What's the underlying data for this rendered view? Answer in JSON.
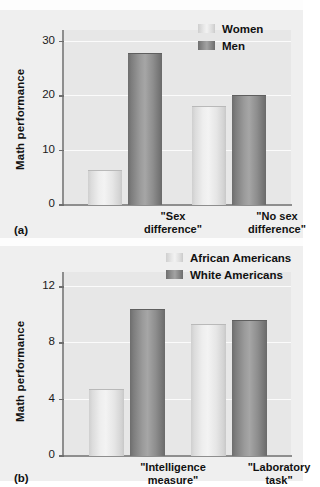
{
  "page": {
    "background_color": "#efefef",
    "paper_color": "#fdfdfd"
  },
  "colors": {
    "light_bar": "#e9e9e9",
    "dark_bar": "#8d8d8d",
    "plot_background": "#e7e7e7",
    "gridline": "#fbfbfb",
    "axis": "#8e8e8e",
    "text": "#111111"
  },
  "figure_a": {
    "panel_label": "(a)",
    "y_axis_title": "Math performance",
    "y_ticks": [
      "0",
      "10",
      "20",
      "30"
    ],
    "legend": [
      {
        "label": "Women",
        "swatch": "light"
      },
      {
        "label": "Men",
        "swatch": "dark"
      }
    ],
    "categories": [
      {
        "line1": "\"Sex",
        "line2": "difference\""
      },
      {
        "line1": "\"No sex",
        "line2": "difference\""
      }
    ]
  },
  "figure_b": {
    "panel_label": "(b)",
    "y_axis_title": "Math performance",
    "y_ticks": [
      "0",
      "4",
      "8",
      "12"
    ],
    "legend": [
      {
        "label": "African Americans",
        "swatch": "light"
      },
      {
        "label": "White Americans",
        "swatch": "dark"
      }
    ],
    "categories": [
      {
        "line1": "\"Intelligence",
        "line2": "measure\""
      },
      {
        "line1": "\"Laboratory",
        "line2": "task\""
      }
    ]
  },
  "chart_data": [
    {
      "type": "bar",
      "title": "(a)",
      "xlabel": "",
      "ylabel": "Math performance",
      "ylim": [
        0,
        32
      ],
      "yticks": [
        0,
        10,
        20,
        30
      ],
      "grid": true,
      "legend_position": "top-right",
      "categories": [
        "\"Sex difference\"",
        "\"No sex difference\""
      ],
      "series": [
        {
          "name": "Women",
          "values": [
            6.3,
            18.0
          ],
          "color": "#e9e9e9"
        },
        {
          "name": "Men",
          "values": [
            27.8,
            20.0
          ],
          "color": "#8d8d8d"
        }
      ]
    },
    {
      "type": "bar",
      "title": "(b)",
      "xlabel": "",
      "ylabel": "Math performance",
      "ylim": [
        0,
        13
      ],
      "yticks": [
        0,
        4,
        8,
        12
      ],
      "grid": true,
      "legend_position": "top-right",
      "categories": [
        "\"Intelligence measure\"",
        "\"Laboratory task\""
      ],
      "series": [
        {
          "name": "African Americans",
          "values": [
            4.7,
            9.3
          ],
          "color": "#e9e9e9"
        },
        {
          "name": "White Americans",
          "values": [
            10.4,
            9.6
          ],
          "color": "#8d8d8d"
        }
      ]
    }
  ]
}
